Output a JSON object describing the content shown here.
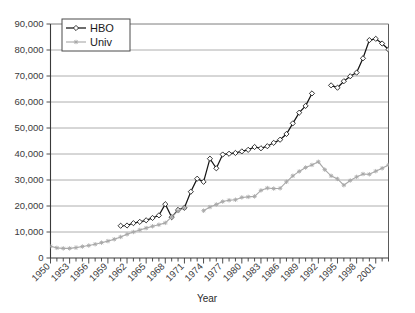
{
  "chart_data": {
    "type": "line",
    "title": "",
    "subtitle": "",
    "xlabel": "Year",
    "ylabel": "",
    "xlim": [
      1950,
      2003
    ],
    "ylim": [
      0,
      90000
    ],
    "grid": true,
    "legend_position": "top-left",
    "y_ticks": [
      0,
      10000,
      20000,
      30000,
      40000,
      50000,
      60000,
      70000,
      80000,
      90000
    ],
    "y_tick_labels": [
      "0",
      "10,000",
      "20,000",
      "30,000",
      "40,000",
      "50,000",
      "60,000",
      "70,000",
      "80,000",
      "90,000"
    ],
    "x_ticks": [
      1950,
      1953,
      1956,
      1959,
      1962,
      1965,
      1968,
      1971,
      1974,
      1977,
      1980,
      1983,
      1986,
      1989,
      1992,
      1995,
      1998,
      2001
    ],
    "x_tick_labels": [
      "1950",
      "1953",
      "1956",
      "1959",
      "1962",
      "1965",
      "1968",
      "1971",
      "1974",
      "1977",
      "1980",
      "1983",
      "1986",
      "1989",
      "1992",
      "1995",
      "1998",
      "2001"
    ],
    "x_minor_tick_step": 1,
    "series": [
      {
        "name": "HBO",
        "color": "#161616",
        "marker": "diamond",
        "x": [
          1961,
          1962,
          1963,
          1964,
          1965,
          1966,
          1967,
          1968,
          1969,
          1970,
          1971,
          1972,
          1973,
          1974,
          1975,
          1976,
          1977,
          1978,
          1979,
          1980,
          1981,
          1982,
          1983,
          1984,
          1985,
          1986,
          1987,
          1988,
          1989,
          1990,
          1991,
          1994,
          1995,
          1996,
          1997,
          1998,
          1999,
          2000,
          2001,
          2002,
          2003
        ],
        "values": [
          12400,
          12500,
          13400,
          13900,
          14500,
          15400,
          16400,
          20700,
          15700,
          18500,
          19300,
          25500,
          30500,
          29300,
          38200,
          34500,
          39800,
          40100,
          40400,
          41000,
          41600,
          42700,
          42200,
          43000,
          44300,
          45500,
          47700,
          51800,
          55900,
          58500,
          63300,
          66400,
          65500,
          68000,
          69900,
          71300,
          76800,
          83800,
          84300,
          82500,
          80200
        ]
      },
      {
        "name": "Univ",
        "color": "#a8a8a8",
        "marker": "cross",
        "x": [
          1950,
          1951,
          1952,
          1953,
          1954,
          1955,
          1956,
          1957,
          1958,
          1959,
          1960,
          1961,
          1962,
          1963,
          1964,
          1965,
          1966,
          1967,
          1968,
          1969,
          1970,
          1971,
          1974,
          1975,
          1976,
          1977,
          1978,
          1979,
          1980,
          1981,
          1982,
          1983,
          1984,
          1985,
          1986,
          1987,
          1988,
          1989,
          1990,
          1991,
          1992,
          1993,
          1994,
          1995,
          1996,
          1997,
          1998,
          1999,
          2000,
          2001,
          2002,
          2003
        ],
        "values": [
          4500,
          3900,
          3700,
          3700,
          4000,
          4400,
          4800,
          5300,
          5900,
          6500,
          7200,
          8100,
          9100,
          10000,
          10800,
          11500,
          12200,
          12800,
          13500,
          15800,
          18100,
          19200,
          18200,
          19600,
          20600,
          21700,
          22200,
          22400,
          23300,
          23500,
          23700,
          26000,
          26900,
          26700,
          26800,
          29300,
          31600,
          33300,
          34800,
          35800,
          37000,
          34000,
          31600,
          30400,
          28000,
          29800,
          31200,
          32300,
          32200,
          33400,
          34500,
          35800
        ]
      }
    ]
  },
  "legend": {
    "entries": [
      {
        "label": "HBO",
        "marker": "diamond-marker-icon"
      },
      {
        "label": "Univ",
        "marker": "cross-marker-icon"
      }
    ]
  },
  "axis": {
    "x_title": "Year"
  }
}
